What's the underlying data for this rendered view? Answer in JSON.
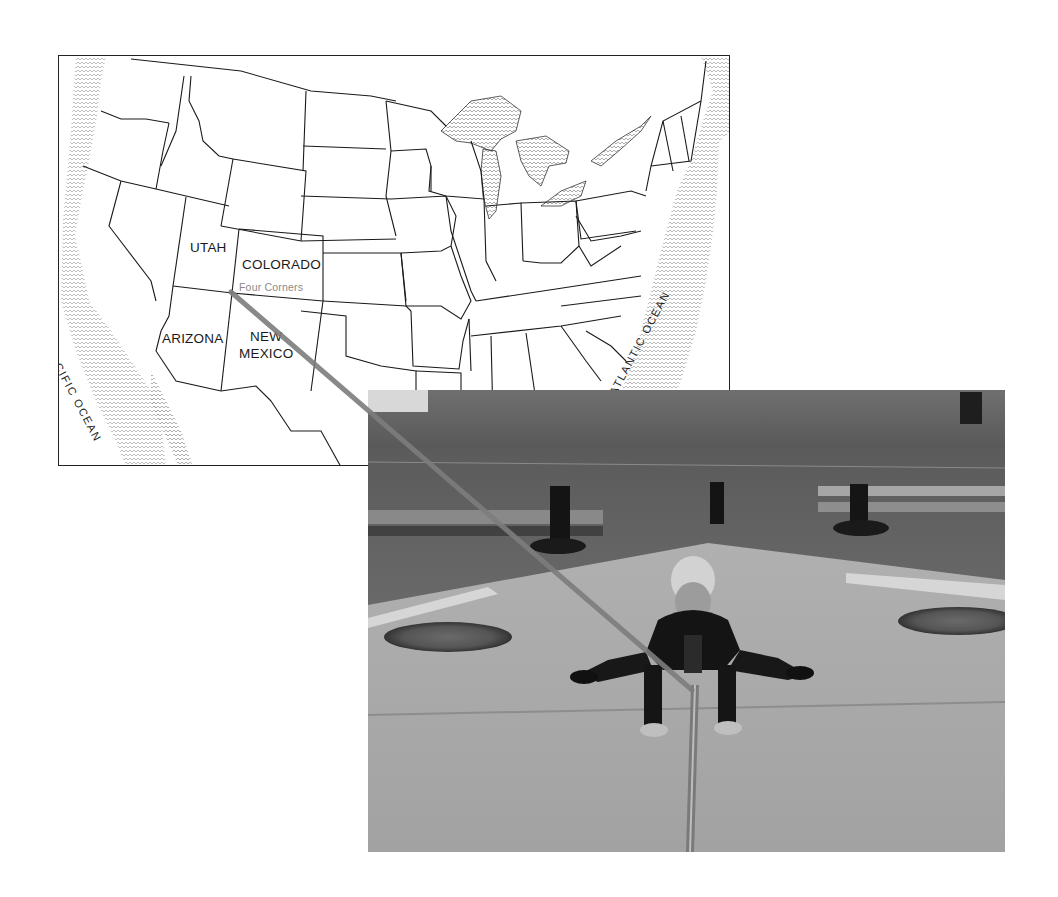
{
  "map": {
    "title": "Map of the contiguous United States",
    "state_labels": [
      {
        "id": "utah",
        "text": "UTAH"
      },
      {
        "id": "colorado",
        "text": "COLORADO"
      },
      {
        "id": "arizona",
        "text": "ARIZONA"
      },
      {
        "id": "new-mexico-1",
        "text": "NEW"
      },
      {
        "id": "new-mexico-2",
        "text": "MEXICO"
      }
    ],
    "annotation": "Four Corners",
    "oceans": {
      "pacific": "PACIFIC OCEAN",
      "atlantic": "ATLANTIC OCEAN"
    },
    "marker_point": {
      "x": 231,
      "y": 292
    }
  },
  "photo": {
    "description": "Black-and-white photo of a child crouching at the Four Corners monument"
  },
  "connector": {
    "color": "#808080",
    "from": {
      "x": 231,
      "y": 292
    },
    "to": {
      "x": 692,
      "y": 690
    }
  }
}
